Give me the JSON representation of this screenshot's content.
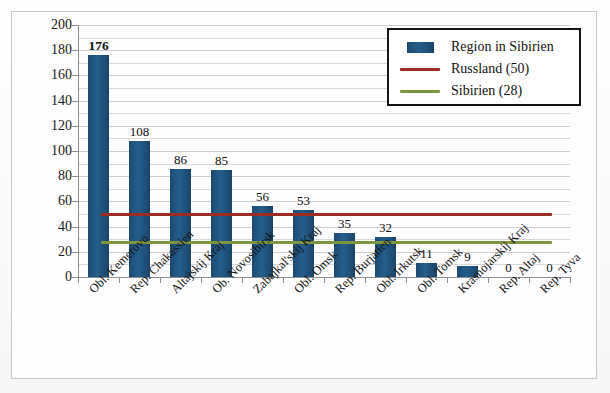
{
  "chart_data": {
    "type": "bar",
    "title": "",
    "subtitle": "",
    "xlabel": "",
    "ylabel": "",
    "ylim": [
      0,
      200
    ],
    "ytick_step": 20,
    "yticks": [
      200,
      180,
      160,
      140,
      120,
      100,
      80,
      60,
      40,
      20,
      0
    ],
    "minor_gridlines": true,
    "minor_gridline_step": 10,
    "grid": true,
    "legend_position": "top-right",
    "categories": [
      "Obl. Kemerovo",
      "Rep. Chakassien",
      "Altajskij Kraj",
      "Ob. Novosibirsk",
      "Zabajkal'skij Kraj",
      "Obl. Omsk",
      "Rep. Burjatien",
      "Obl. Irkutsk",
      "Obl. Tomsk",
      "Krasnojarskij Kraj",
      "Rep. Altaj",
      "Rep. Tyva"
    ],
    "values": [
      176,
      108,
      86,
      85,
      56,
      53,
      35,
      32,
      11,
      9,
      0,
      0
    ],
    "bar_series_name": "Region in Sibirien",
    "reference_lines": [
      {
        "name": "Russland (50)",
        "value": 50,
        "color": "#9c2b22"
      },
      {
        "name": "Sibirien (28)",
        "value": 28,
        "color": "#7e9440"
      }
    ],
    "bar_color": "#1f5280",
    "emphasized_label_index": 0
  },
  "legend": {
    "items": [
      {
        "label": "Region in Sibirien",
        "marker": "bar",
        "color": "#1f5280"
      },
      {
        "label": "Russland (50)",
        "marker": "line",
        "color": "#9c2b22"
      },
      {
        "label": "Sibirien (28)",
        "marker": "line",
        "color": "#7e9440"
      }
    ]
  }
}
